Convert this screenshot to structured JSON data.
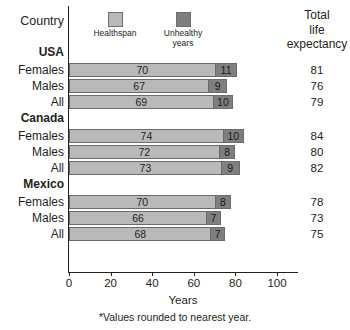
{
  "header": {
    "country_label": "Country",
    "total_line1": "Total",
    "total_line2": "life",
    "total_line3": "expectancy"
  },
  "legend": {
    "items": [
      {
        "label": "Healthspan",
        "color": "#b9b9b9",
        "key": "healthspan"
      },
      {
        "label": "Unhealthy\nyears",
        "label_line1": "Unhealthy",
        "label_line2": "years",
        "color": "#7f7f7f",
        "key": "unhealthy"
      }
    ]
  },
  "axis": {
    "title": "Years",
    "ticks": [
      0,
      20,
      40,
      60,
      80,
      100
    ],
    "min": 0,
    "max": 110
  },
  "footnote": "*Values rounded to nearest year.",
  "rows": [
    {
      "type": "country",
      "label": "USA"
    },
    {
      "type": "data",
      "label": "Females",
      "healthspan": 70,
      "unhealthy": 11,
      "total": 81
    },
    {
      "type": "data",
      "label": "Males",
      "healthspan": 67,
      "unhealthy": 9,
      "total": 76
    },
    {
      "type": "data",
      "label": "All",
      "healthspan": 69,
      "unhealthy": 10,
      "total": 79
    },
    {
      "type": "country",
      "label": "Canada"
    },
    {
      "type": "data",
      "label": "Females",
      "healthspan": 74,
      "unhealthy": 10,
      "total": 84
    },
    {
      "type": "data",
      "label": "Males",
      "healthspan": 72,
      "unhealthy": 8,
      "total": 80
    },
    {
      "type": "data",
      "label": "All",
      "healthspan": 73,
      "unhealthy": 9,
      "total": 82
    },
    {
      "type": "country",
      "label": "Mexico"
    },
    {
      "type": "data",
      "label": "Females",
      "healthspan": 70,
      "unhealthy": 8,
      "total": 78
    },
    {
      "type": "data",
      "label": "Males",
      "healthspan": 66,
      "unhealthy": 7,
      "total": 73
    },
    {
      "type": "data",
      "label": "All",
      "healthspan": 68,
      "unhealthy": 7,
      "total": 75
    }
  ],
  "chart_data": {
    "type": "bar",
    "title": "",
    "orientation": "horizontal",
    "stacked": true,
    "xlabel": "Years",
    "ylabel": "Country",
    "xlim": [
      0,
      110
    ],
    "xticks": [
      0,
      20,
      40,
      60,
      80,
      100
    ],
    "grid": false,
    "legend_position": "top",
    "annotation": "*Values rounded to nearest year.",
    "extra_column": "Total life expectancy",
    "groups": [
      "USA",
      "Canada",
      "Mexico"
    ],
    "categories": [
      "USA Females",
      "USA Males",
      "USA All",
      "Canada Females",
      "Canada Males",
      "Canada All",
      "Mexico Females",
      "Mexico Males",
      "Mexico All"
    ],
    "series": [
      {
        "name": "Healthspan",
        "color": "#b9b9b9",
        "values": [
          70,
          67,
          69,
          74,
          72,
          73,
          70,
          66,
          68
        ]
      },
      {
        "name": "Unhealthy years",
        "color": "#7f7f7f",
        "values": [
          11,
          9,
          10,
          10,
          8,
          9,
          8,
          7,
          7
        ]
      }
    ],
    "totals": [
      81,
      76,
      79,
      84,
      80,
      82,
      78,
      73,
      75
    ]
  }
}
